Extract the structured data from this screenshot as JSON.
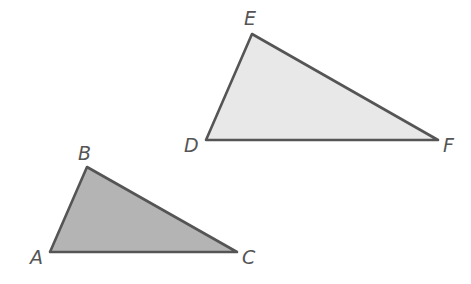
{
  "diagram": {
    "type": "similar-triangles",
    "colors": {
      "stroke": "#555555",
      "triangle_def_fill": "#e8e8e8",
      "triangle_abc_fill": "#b4b4b4",
      "label": "#555555"
    },
    "triangles": [
      {
        "name": "DEF",
        "vertices": [
          {
            "label": "D",
            "x": 206,
            "y": 140
          },
          {
            "label": "E",
            "x": 252,
            "y": 34
          },
          {
            "label": "F",
            "x": 438,
            "y": 140
          }
        ]
      },
      {
        "name": "ABC",
        "vertices": [
          {
            "label": "A",
            "x": 50,
            "y": 252
          },
          {
            "label": "B",
            "x": 87,
            "y": 167
          },
          {
            "label": "C",
            "x": 237,
            "y": 252
          }
        ]
      }
    ],
    "labels": {
      "D": "D",
      "E": "E",
      "F": "F",
      "A": "A",
      "B": "B",
      "C": "C"
    }
  }
}
